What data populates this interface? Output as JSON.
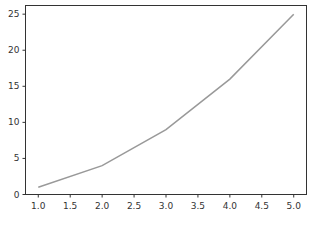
{
  "chart_data": {
    "type": "line",
    "title": "",
    "xlabel": "",
    "ylabel": "",
    "x": [
      1.0,
      2.0,
      3.0,
      4.0,
      5.0
    ],
    "series": [
      {
        "name": "",
        "values": [
          1,
          4,
          9,
          16,
          25
        ],
        "color": "#999999"
      }
    ],
    "xlim": [
      0.8,
      5.2
    ],
    "ylim": [
      0,
      26.2
    ],
    "xticks": [
      "1.0",
      "1.5",
      "2.0",
      "2.5",
      "3.0",
      "3.5",
      "4.0",
      "4.5",
      "5.0"
    ],
    "yticks": [
      "0",
      "5",
      "10",
      "15",
      "20",
      "25"
    ],
    "grid": false,
    "legend": null
  }
}
